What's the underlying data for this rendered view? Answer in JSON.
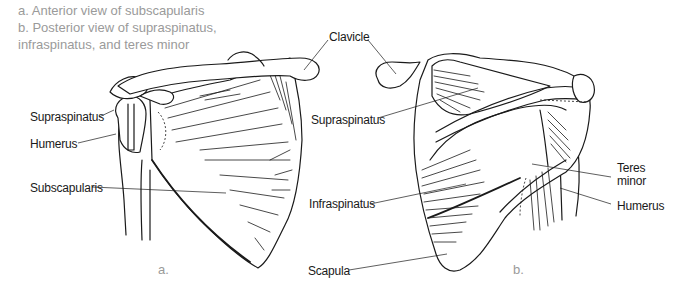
{
  "caption": {
    "line1": "a. Anterior view of subscapularis",
    "line2": "b. Posterior view of supraspinatus,",
    "line3": "infraspinatus, and teres minor"
  },
  "labels": {
    "clavicle": "Clavicle",
    "supraspinatus_a": "Supraspinatus",
    "humerus_a": "Humerus",
    "subscapularis": "Subscapularis",
    "supraspinatus_b": "Supraspinatus",
    "infraspinatus": "Infraspinatus",
    "scapula": "Scapula",
    "teres_line1": "Teres",
    "teres_line2": "minor",
    "humerus_b": "Humerus"
  },
  "figures": {
    "a": "a.",
    "b": "b."
  },
  "colors": {
    "ink": "#1a1a1a",
    "caption": "#9a9a9a",
    "background": "#ffffff"
  }
}
